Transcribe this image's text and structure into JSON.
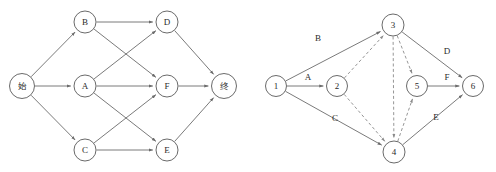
{
  "figure": {
    "title": "",
    "panels": [
      {
        "id": "left-graph",
        "name": "aov-activity-on-vertex-network",
        "kind": "directed-graph",
        "nodes": [
          {
            "id": "start",
            "label": "始",
            "x": 22,
            "y": 86,
            "r": 12.5,
            "script": "cjk"
          },
          {
            "id": "B",
            "label": "B",
            "x": 85,
            "y": 22,
            "r": 11,
            "script": "latin"
          },
          {
            "id": "D",
            "label": "D",
            "x": 167,
            "y": 22,
            "r": 11,
            "script": "latin"
          },
          {
            "id": "A",
            "label": "A",
            "x": 85,
            "y": 86,
            "r": 11,
            "script": "latin"
          },
          {
            "id": "F",
            "label": "F",
            "x": 167,
            "y": 86,
            "r": 11,
            "script": "latin"
          },
          {
            "id": "end",
            "label": "终",
            "x": 224,
            "y": 86,
            "r": 12.5,
            "script": "cjk"
          },
          {
            "id": "C",
            "label": "C",
            "x": 85,
            "y": 150,
            "r": 11,
            "script": "latin"
          },
          {
            "id": "E",
            "label": "E",
            "x": 167,
            "y": 150,
            "r": 11,
            "script": "latin"
          }
        ],
        "edges": [
          {
            "from": "start",
            "to": "B",
            "style": "solid",
            "label": ""
          },
          {
            "from": "start",
            "to": "A",
            "style": "solid",
            "label": ""
          },
          {
            "from": "start",
            "to": "C",
            "style": "solid",
            "label": ""
          },
          {
            "from": "B",
            "to": "D",
            "style": "solid",
            "label": ""
          },
          {
            "from": "B",
            "to": "F",
            "style": "solid",
            "label": ""
          },
          {
            "from": "A",
            "to": "D",
            "style": "solid",
            "label": ""
          },
          {
            "from": "A",
            "to": "F",
            "style": "solid",
            "label": ""
          },
          {
            "from": "A",
            "to": "E",
            "style": "solid",
            "label": ""
          },
          {
            "from": "C",
            "to": "F",
            "style": "solid",
            "label": ""
          },
          {
            "from": "C",
            "to": "E",
            "style": "solid",
            "label": ""
          },
          {
            "from": "D",
            "to": "end",
            "style": "solid",
            "label": ""
          },
          {
            "from": "F",
            "to": "end",
            "style": "solid",
            "label": ""
          },
          {
            "from": "E",
            "to": "end",
            "style": "solid",
            "label": ""
          }
        ]
      },
      {
        "id": "right-graph",
        "name": "aoe-activity-on-edge-network",
        "kind": "directed-graph",
        "nodes": [
          {
            "id": "1",
            "label": "1",
            "x": 276,
            "y": 86,
            "r": 10.5,
            "script": "latin"
          },
          {
            "id": "2",
            "label": "2",
            "x": 337,
            "y": 86,
            "r": 10.5,
            "script": "latin"
          },
          {
            "id": "3",
            "label": "3",
            "x": 393,
            "y": 25,
            "r": 11,
            "script": "latin"
          },
          {
            "id": "4",
            "label": "4",
            "x": 394,
            "y": 152,
            "r": 11,
            "script": "latin"
          },
          {
            "id": "5",
            "label": "5",
            "x": 417,
            "y": 86,
            "r": 10.5,
            "script": "latin"
          },
          {
            "id": "6",
            "label": "6",
            "x": 473,
            "y": 86,
            "r": 10.5,
            "script": "latin"
          }
        ],
        "edges": [
          {
            "from": "1",
            "to": "2",
            "style": "solid",
            "label": "A",
            "lx": 308,
            "ly": 78
          },
          {
            "from": "1",
            "to": "3",
            "style": "solid",
            "label": "B",
            "lx": 318,
            "ly": 39
          },
          {
            "from": "1",
            "to": "4",
            "style": "solid",
            "label": "C",
            "lx": 335,
            "ly": 119
          },
          {
            "from": "3",
            "to": "6",
            "style": "solid",
            "label": "D",
            "lx": 447,
            "ly": 52
          },
          {
            "from": "4",
            "to": "6",
            "style": "solid",
            "label": "E",
            "lx": 436,
            "ly": 118
          },
          {
            "from": "5",
            "to": "6",
            "style": "solid",
            "label": "F",
            "lx": 447,
            "ly": 78
          },
          {
            "from": "2",
            "to": "3",
            "style": "dashed",
            "label": "",
            "lx": 0,
            "ly": 0
          },
          {
            "from": "2",
            "to": "4",
            "style": "dashed",
            "label": "",
            "lx": 0,
            "ly": 0
          },
          {
            "from": "3",
            "to": "5",
            "style": "dashed",
            "label": "",
            "lx": 0,
            "ly": 0
          },
          {
            "from": "4",
            "to": "5",
            "style": "dashed",
            "label": "",
            "lx": 0,
            "ly": 0
          },
          {
            "from": "3",
            "to": "4",
            "style": "dashed",
            "label": "",
            "lx": 0,
            "ly": 0
          }
        ]
      }
    ],
    "colors": {
      "node_stroke": "#595959",
      "node_fill": "#ffffff",
      "edge_solid": "#6b6b6b",
      "edge_dashed": "#8a8a8a",
      "text": "#2b2b2b",
      "background": "#ffffff"
    }
  }
}
